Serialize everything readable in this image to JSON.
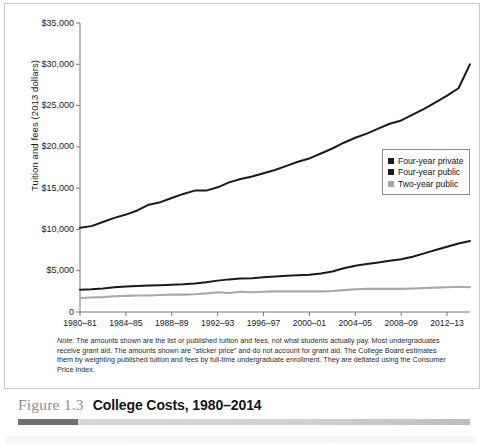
{
  "figure": {
    "number": "Figure 1.3",
    "title": "College Costs, 1980–2014"
  },
  "note": {
    "label": "Note:",
    "text": " The amounts shown are the list or published tuition and fees, not what students actually pay. Most undergraduates receive grant aid. The amounts shown are \"sticker price\" and do not account for grant aid. The College Board estimates them by weighting published tuition and fees by full-time undergraduate enrollment. They are deflated using the Consumer Price Index."
  },
  "legend": {
    "items": [
      {
        "label": "Four-year private",
        "color": "#1a1a1a"
      },
      {
        "label": "Four-year public",
        "color": "#1a1a1a"
      },
      {
        "label": "Two-year public",
        "color": "#a8a8a8"
      }
    ]
  },
  "chart_data": {
    "type": "line",
    "title": "College Costs, 1980–2014",
    "xlabel": "",
    "ylabel": "Tuition and fees (2013 dollars)",
    "ylim": [
      0,
      35000
    ],
    "yticks": [
      0,
      5000,
      10000,
      15000,
      20000,
      25000,
      30000,
      35000
    ],
    "ytick_labels": [
      "0",
      "$5,000",
      "$10,000",
      "$15,000",
      "$20,000",
      "$25,000",
      "$30,000",
      "$35,000"
    ],
    "xtick_labels": [
      "1980–81",
      "1984–85",
      "1988–89",
      "1992–93",
      "1996–97",
      "2000–01",
      "2004–05",
      "2008–09",
      "2012–13"
    ],
    "xtick_years": [
      1980,
      1984,
      1988,
      1992,
      1996,
      2000,
      2004,
      2008,
      2012
    ],
    "xlim": [
      1980,
      2014
    ],
    "grid": false,
    "legend_position": "right",
    "x": [
      1980,
      1981,
      1982,
      1983,
      1984,
      1985,
      1986,
      1987,
      1988,
      1989,
      1990,
      1991,
      1992,
      1993,
      1994,
      1995,
      1996,
      1997,
      1998,
      1999,
      2000,
      2001,
      2002,
      2003,
      2004,
      2005,
      2006,
      2007,
      2008,
      2009,
      2010,
      2011,
      2012,
      2013,
      2014
    ],
    "series": [
      {
        "name": "Four-year private",
        "color": "#1a1a1a",
        "values": [
          10200,
          10400,
          10900,
          11400,
          11800,
          12300,
          13000,
          13300,
          13800,
          14300,
          14700,
          14700,
          15100,
          15700,
          16100,
          16400,
          16800,
          17200,
          17700,
          18200,
          18600,
          19200,
          19800,
          20500,
          21100,
          21600,
          22200,
          22800,
          23200,
          23900,
          24600,
          25400,
          26200,
          27100,
          30000
        ]
      },
      {
        "name": "Four-year public",
        "color": "#1a1a1a",
        "values": [
          2700,
          2750,
          2850,
          3000,
          3100,
          3150,
          3200,
          3250,
          3300,
          3350,
          3450,
          3600,
          3800,
          3950,
          4050,
          4100,
          4200,
          4300,
          4400,
          4450,
          4500,
          4650,
          4900,
          5300,
          5600,
          5800,
          6000,
          6200,
          6400,
          6700,
          7100,
          7500,
          7900,
          8300,
          8600
        ]
      },
      {
        "name": "Two-year public",
        "color": "#a8a8a8",
        "values": [
          1700,
          1750,
          1800,
          1900,
          1950,
          2000,
          2000,
          2050,
          2100,
          2100,
          2150,
          2250,
          2400,
          2300,
          2450,
          2400,
          2450,
          2500,
          2500,
          2500,
          2500,
          2500,
          2550,
          2650,
          2750,
          2800,
          2800,
          2800,
          2800,
          2850,
          2900,
          2950,
          3000,
          3050,
          3000
        ]
      }
    ]
  }
}
